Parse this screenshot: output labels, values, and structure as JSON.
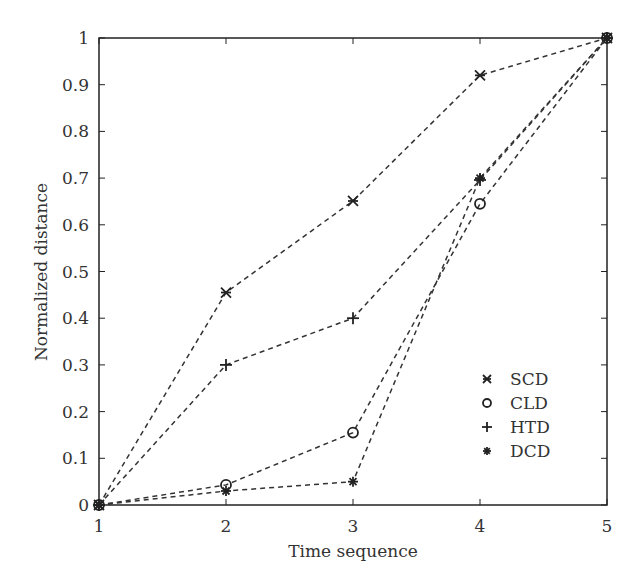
{
  "chart_data": {
    "type": "line",
    "title": "",
    "xlabel": "Time sequence",
    "ylabel": "Normalized distance",
    "x": [
      1,
      2,
      3,
      4,
      5
    ],
    "xlim": [
      1,
      5
    ],
    "ylim": [
      0,
      1
    ],
    "xticks": [
      "1",
      "2",
      "3",
      "4",
      "5"
    ],
    "yticks": [
      "0",
      "0.1",
      "0.2",
      "0.3",
      "0.4",
      "0.5",
      "0.6",
      "0.7",
      "0.8",
      "0.9",
      "1"
    ],
    "grid": false,
    "legend_position": "lower right",
    "series": [
      {
        "name": "SCD",
        "marker": "x",
        "values": [
          0,
          0.455,
          0.651,
          0.92,
          1
        ]
      },
      {
        "name": "CLD",
        "marker": "o",
        "values": [
          0,
          0.043,
          0.155,
          0.645,
          1
        ]
      },
      {
        "name": "HTD",
        "marker": "+",
        "values": [
          0,
          0.3,
          0.4,
          0.696,
          1
        ]
      },
      {
        "name": "DCD",
        "marker": "*",
        "values": [
          0,
          0.03,
          0.05,
          0.7,
          1
        ]
      }
    ]
  },
  "legend": [
    {
      "symbol": "x:",
      "label": "SCD"
    },
    {
      "symbol": "o:",
      "label": "CLD"
    },
    {
      "symbol": "+:",
      "label": "HTD"
    },
    {
      "symbol": "*:",
      "label": "DCD"
    }
  ]
}
